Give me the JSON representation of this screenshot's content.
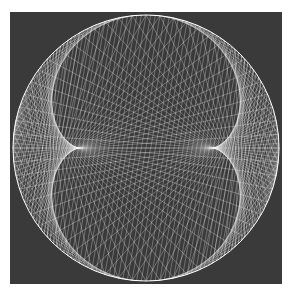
{
  "figure": {
    "background": "#3a3a3a",
    "page_background": "#ffffff",
    "line_color": "#ffffff",
    "circle": {
      "cx": 136,
      "cy": 136,
      "r": 133
    },
    "pattern": "string-art envelope of chords forming two lobes inside a circle",
    "chord_count": 180,
    "multiplier": 3
  }
}
